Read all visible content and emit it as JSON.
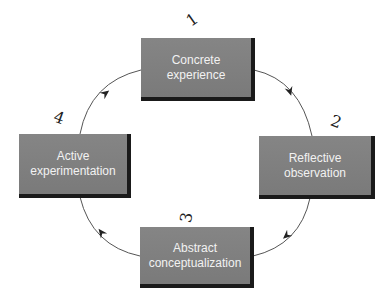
{
  "diagram": {
    "type": "cycle",
    "stages": [
      {
        "number": "1",
        "line1": "Concrete",
        "line2": "experience"
      },
      {
        "number": "2",
        "line1": "Reflective",
        "line2": "observation"
      },
      {
        "number": "3",
        "line1": "Abstract",
        "line2": "conceptualization"
      },
      {
        "number": "4",
        "line1": "Active",
        "line2": "experimentation"
      }
    ],
    "flow": "clockwise",
    "colors": {
      "box_fill": "#7f7f7f",
      "box_shadow": "#1a1a1a",
      "box_text": "#f2f2f2",
      "arrow": "#555555"
    }
  }
}
